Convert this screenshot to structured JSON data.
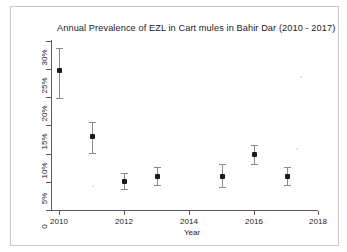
{
  "chart_data": {
    "type": "scatter",
    "title": "Annual Prevalence of EZL in Cart mules in Bahir Dar (2010 - 2017)",
    "xlabel": "Year",
    "ylabel": "",
    "xlim": [
      2009.3,
      2018.2
    ],
    "ylim": [
      0,
      31
    ],
    "grid": false,
    "legend": null,
    "x_tick_labels": [
      "2010",
      "2012",
      "2014",
      "2016",
      "2018"
    ],
    "x_ticks": [
      2010,
      2012,
      2014,
      2016,
      2018
    ],
    "y_tick_labels": [
      "0",
      "5%",
      "10%",
      "15%",
      "20%",
      "25%",
      "30%"
    ],
    "y_ticks": [
      0,
      5,
      10,
      15,
      20,
      25,
      30
    ],
    "x": [
      2010,
      2011,
      2012,
      2013,
      2015,
      2016,
      2017
    ],
    "values": [
      24.8,
      13.1,
      5.1,
      6.0,
      6.0,
      9.9,
      6.0
    ],
    "error_low": [
      19.9,
      10.1,
      3.7,
      4.5,
      4.0,
      8.2,
      4.5
    ],
    "error_high": [
      28.7,
      15.6,
      6.6,
      7.6,
      8.2,
      11.6,
      7.6
    ],
    "marker_color": "#1a1a1a",
    "errorbar_color": "#8a8a8a",
    "axis_color": "#5a5a5a",
    "background_color": "#ffffff",
    "points": [
      {
        "year": 2010,
        "value": 24.8,
        "low": 19.9,
        "high": 28.7
      },
      {
        "year": 2011,
        "value": 13.1,
        "low": 10.1,
        "high": 15.6
      },
      {
        "year": 2012,
        "value": 5.1,
        "low": 3.7,
        "high": 6.6
      },
      {
        "year": 2013,
        "value": 6.0,
        "low": 4.5,
        "high": 7.6
      },
      {
        "year": 2015,
        "value": 6.0,
        "low": 4.0,
        "high": 8.2
      },
      {
        "year": 2016,
        "value": 9.9,
        "low": 8.2,
        "high": 11.6
      },
      {
        "year": 2017,
        "value": 6.0,
        "low": 4.5,
        "high": 7.6
      }
    ]
  },
  "figure": {
    "title": "Annual Prevalence of EZL in Cart mules in Bahir Dar (2010 - 2017)",
    "x_axis_title": "Year",
    "y_labels": {
      "t0": "0",
      "t5": "5%",
      "t10": "10%",
      "t15": "15%",
      "t20": "20%",
      "t25": "25%",
      "t30": "30%"
    },
    "x_labels": {
      "t2010": "2010",
      "t2012": "2012",
      "t2014": "2014",
      "t2016": "2016",
      "t2018": "2018"
    }
  }
}
